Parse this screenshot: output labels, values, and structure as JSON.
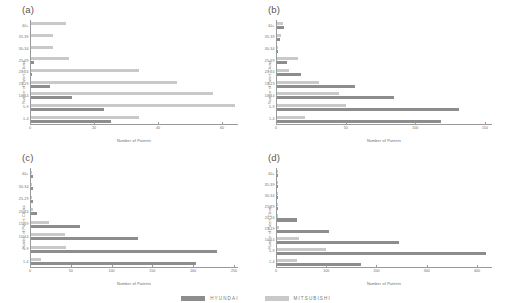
{
  "figure": {
    "legend": {
      "items": [
        {
          "label": "HYUNDAI",
          "color": "#8d8d8d",
          "key": "hyundai"
        },
        {
          "label": "MITSUBISHI",
          "color": "#c9c9c9",
          "key": "mitsubishi"
        }
      ]
    }
  },
  "chart_data": [
    {
      "type": "bar",
      "orientation": "horizontal",
      "panel": "(a)",
      "title": "",
      "xlabel": "Number of Patents",
      "ylabel": "Number of Patent Claims",
      "categories": [
        "1-4",
        "5-9",
        "10-14",
        "15-19",
        "20-24",
        "25-29",
        "30-34",
        "35-39",
        "40+"
      ],
      "xlim": [
        0,
        65
      ],
      "xticks": [
        0,
        20,
        40,
        60
      ],
      "grid": false,
      "legend_position": "bottom",
      "series": [
        {
          "name": "HYUNDAI",
          "values": [
            25,
            23,
            13,
            6,
            0.4,
            0.8,
            0,
            0,
            0
          ]
        },
        {
          "name": "MITSUBISHI",
          "values": [
            34,
            64,
            57,
            46,
            34,
            12,
            7,
            7,
            11
          ]
        }
      ]
    },
    {
      "type": "bar",
      "orientation": "horizontal",
      "panel": "(b)",
      "title": "",
      "xlabel": "Number of Patents",
      "ylabel": "Number of Patent Claims",
      "categories": [
        "1-4",
        "5-9",
        "10-14",
        "15-19",
        "20-24",
        "25-29",
        "30-34",
        "35-39",
        "40+"
      ],
      "xlim": [
        0,
        155
      ],
      "xticks": [
        0,
        50,
        100,
        150
      ],
      "grid": false,
      "legend_position": "bottom",
      "series": [
        {
          "name": "HYUNDAI",
          "values": [
            118,
            131,
            84,
            56,
            17,
            7,
            1,
            2,
            5
          ]
        },
        {
          "name": "MITSUBISHI",
          "values": [
            20,
            50,
            45,
            30,
            9,
            15,
            1,
            3,
            4
          ]
        }
      ]
    },
    {
      "type": "bar",
      "orientation": "horizontal",
      "panel": "(c)",
      "title": "",
      "xlabel": "Number of Patents",
      "ylabel": "Number of Patent Claims",
      "categories": [
        "1-4",
        "5-9",
        "10-14",
        "15-19",
        "20-24",
        "25-29",
        "30-34",
        "40+"
      ],
      "xlim": [
        0,
        255
      ],
      "xticks": [
        0,
        50,
        100,
        150,
        200,
        250
      ],
      "grid": false,
      "legend_position": "bottom",
      "series": [
        {
          "name": "HYUNDAI",
          "values": [
            203,
            229,
            132,
            60,
            7,
            2,
            2,
            2
          ]
        },
        {
          "name": "MITSUBISHI",
          "values": [
            12,
            43,
            42,
            22,
            2,
            1,
            1,
            1
          ]
        }
      ]
    },
    {
      "type": "bar",
      "orientation": "horizontal",
      "panel": "(d)",
      "title": "",
      "xlabel": "Number of Patents",
      "ylabel": "Number of Patent Claims",
      "categories": [
        "1-4",
        "5-9",
        "10-14",
        "15-19",
        "20-24",
        "25-29",
        "30-34",
        "35-39",
        "40+"
      ],
      "xlim": [
        0,
        430
      ],
      "xticks": [
        0,
        100,
        200,
        300,
        400
      ],
      "grid": false,
      "legend_position": "bottom",
      "series": [
        {
          "name": "HYUNDAI",
          "values": [
            168,
            417,
            243,
            104,
            40,
            1,
            2,
            1,
            1
          ]
        },
        {
          "name": "MITSUBISHI",
          "values": [
            40,
            97,
            43,
            3,
            1,
            1,
            2,
            1,
            2
          ]
        }
      ]
    }
  ]
}
